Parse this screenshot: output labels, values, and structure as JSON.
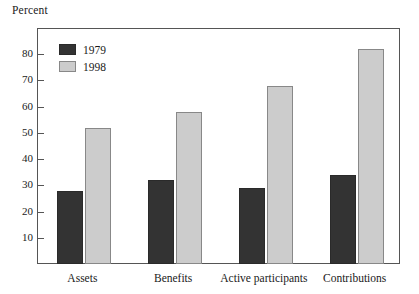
{
  "chart_data": {
    "type": "bar",
    "title": "",
    "subtitle": "",
    "xlabel": "",
    "ylabel": "Percent",
    "categories": [
      "Assets",
      "Benefits",
      "Active participants",
      "Contributions"
    ],
    "series": [
      {
        "name": "1979",
        "color": "#333333",
        "values": [
          28,
          32,
          29,
          34
        ]
      },
      {
        "name": "1998",
        "color": "#cccccc",
        "values": [
          52,
          58,
          68,
          82
        ]
      }
    ],
    "ylim": [
      0,
      90
    ],
    "yticks": [
      10,
      20,
      30,
      40,
      50,
      60,
      70,
      80
    ],
    "ytick_labels": [
      "10",
      "20",
      "30",
      "40",
      "50",
      "60",
      "70",
      "80"
    ],
    "grid": false,
    "legend_position": "top-left",
    "legend_entries": [
      "1979",
      "1998"
    ],
    "frame": true,
    "annotations": []
  },
  "colors": {
    "series_1979": "#333333",
    "series_1998": "#cccccc",
    "axis": "#555555",
    "text": "#1a1a1a",
    "background": "#ffffff"
  }
}
